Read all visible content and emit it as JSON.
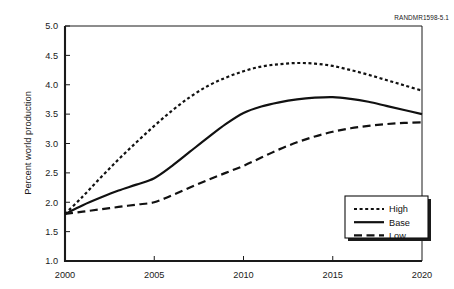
{
  "figure": {
    "corner_id": "RANDMR1598-5.1"
  },
  "chart_data": {
    "type": "line",
    "title": "",
    "subtitle": "",
    "xlabel": "",
    "ylabel": "Percent world production",
    "xlim": [
      2000,
      2020
    ],
    "ylim": [
      1.0,
      5.0
    ],
    "xticks": [
      2000,
      2005,
      2010,
      2015,
      2020
    ],
    "xtick_labels": [
      "2000",
      "2005",
      "2010",
      "2015",
      "2020"
    ],
    "yticks": [
      1.0,
      1.5,
      2.0,
      2.5,
      3.0,
      3.5,
      4.0,
      4.5,
      5.0
    ],
    "ytick_labels": [
      "1.0",
      "1.5",
      "2.0",
      "2.5",
      "3.0",
      "3.5",
      "4.0",
      "4.5",
      "5.0"
    ],
    "grid": false,
    "legend_position": "lower right",
    "x": [
      2000,
      2001,
      2002,
      2003,
      2004,
      2005,
      2006,
      2007,
      2008,
      2009,
      2010,
      2011,
      2012,
      2013,
      2014,
      2015,
      2016,
      2017,
      2018,
      2019,
      2020
    ],
    "series": [
      {
        "name": "High",
        "style": "dotted",
        "values": [
          1.8,
          2.1,
          2.42,
          2.73,
          3.02,
          3.3,
          3.56,
          3.79,
          3.98,
          4.12,
          4.23,
          4.31,
          4.35,
          4.37,
          4.36,
          4.32,
          4.25,
          4.17,
          4.08,
          3.99,
          3.9
        ]
      },
      {
        "name": "Base",
        "style": "solid",
        "values": [
          1.8,
          1.95,
          2.08,
          2.2,
          2.3,
          2.41,
          2.62,
          2.86,
          3.1,
          3.33,
          3.52,
          3.63,
          3.7,
          3.75,
          3.78,
          3.79,
          3.76,
          3.71,
          3.64,
          3.57,
          3.5
        ]
      },
      {
        "name": "Low",
        "style": "dashed",
        "values": [
          1.8,
          1.84,
          1.88,
          1.92,
          1.96,
          2.0,
          2.12,
          2.25,
          2.38,
          2.5,
          2.62,
          2.76,
          2.9,
          3.02,
          3.12,
          3.2,
          3.26,
          3.3,
          3.33,
          3.35,
          3.36
        ]
      }
    ]
  },
  "legend": {
    "entries": [
      {
        "label": "High"
      },
      {
        "label": "Base"
      },
      {
        "label": "Low"
      }
    ]
  }
}
